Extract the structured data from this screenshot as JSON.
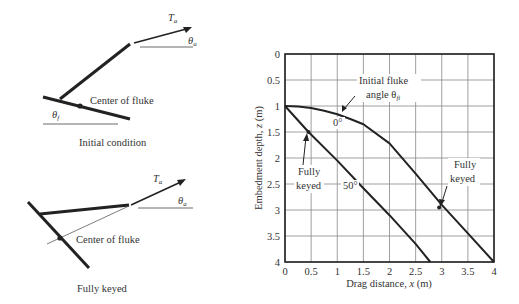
{
  "diagram": {
    "top": {
      "force_label": "T",
      "force_sub": "a",
      "anchor_angle_label": "θ",
      "anchor_angle_sub": "a",
      "fluke_angle_label": "θ",
      "fluke_angle_sub": "f",
      "center_label": "Center of fluke",
      "caption": "Initial condition"
    },
    "bottom": {
      "force_label": "T",
      "force_sub": "a",
      "anchor_angle_label": "θ",
      "anchor_angle_sub": "a",
      "center_label": "Center of fluke",
      "caption": "Fully keyed"
    }
  },
  "chart_data": {
    "type": "line",
    "title": "",
    "xlabel": "Drag distance, x (m)",
    "ylabel": "Embedment depth, z (m)",
    "xlim": [
      0,
      4
    ],
    "ylim": [
      0,
      4
    ],
    "y_inverted": true,
    "grid": true,
    "xticks": [
      "0",
      "0.5",
      "1",
      "1.5",
      "2",
      "2.5",
      "3",
      "3.5",
      "4"
    ],
    "yticks": [
      "0",
      "0.5",
      "1",
      "1.5",
      "2",
      "2.5",
      "3",
      "3.5",
      "4"
    ],
    "series": [
      {
        "name": "0°",
        "x": [
          0,
          0.25,
          0.5,
          0.75,
          1.0,
          1.25,
          1.5,
          2.0,
          2.5,
          3.0,
          3.5,
          4.0
        ],
        "z": [
          1.0,
          1.01,
          1.04,
          1.09,
          1.16,
          1.25,
          1.35,
          1.72,
          2.3,
          2.9,
          3.45,
          4.0
        ]
      },
      {
        "name": "50°",
        "x": [
          0,
          0.45,
          1.0,
          1.5,
          2.0,
          2.5,
          2.78
        ],
        "z": [
          1.0,
          1.5,
          2.05,
          2.58,
          3.1,
          3.65,
          4.0
        ]
      }
    ],
    "markers": [
      {
        "label": "Fully keyed",
        "series": "50°",
        "x": 0.45,
        "z": 1.5
      },
      {
        "label": "Fully keyed",
        "series": "0°",
        "x": 2.95,
        "z": 2.95
      }
    ],
    "annotations": [
      {
        "text": "Initial fluke",
        "text2": "angle θ",
        "sub": "fi"
      },
      {
        "text": "0°"
      },
      {
        "text": "50°"
      },
      {
        "text": "Fully",
        "text2": "keyed"
      },
      {
        "text": "Fully",
        "text2": "keyed"
      }
    ]
  }
}
